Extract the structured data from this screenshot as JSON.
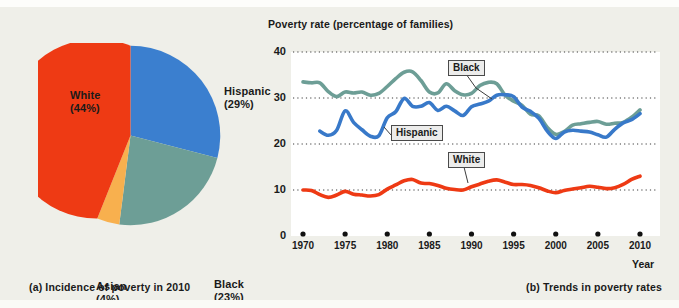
{
  "figure": {
    "panel_a_caption": "(a) Incidence of poverty in 2010",
    "panel_b_caption": "(b) Trends in poverty rates"
  },
  "pie": {
    "slices": [
      {
        "label": "Hispanic",
        "pct_text": "(29%)",
        "value": 29,
        "color": "#3b7fcf"
      },
      {
        "label": "Black",
        "pct_text": "(23%)",
        "value": 23,
        "color": "#6d9e96"
      },
      {
        "label": "Asian",
        "pct_text": "(4%)",
        "value": 4,
        "color": "#f8b04e"
      },
      {
        "label": "White",
        "pct_text": "(44%)",
        "value": 44,
        "color": "#ee3a14"
      }
    ]
  },
  "chart_data": {
    "type": "line",
    "title": "Poverty rate (percentage of families)",
    "xlabel": "Year",
    "ylabel": "",
    "xlim": [
      1970,
      2010
    ],
    "ylim": [
      0,
      40
    ],
    "grid": true,
    "yticks": [
      40,
      30,
      20,
      10,
      0
    ],
    "xticks": [
      1970,
      1975,
      1980,
      1985,
      1990,
      1995,
      2000,
      2005,
      2010
    ],
    "legend_position": "inline-annotations",
    "annotations": [
      {
        "text": "Black",
        "series": "Black"
      },
      {
        "text": "Hispanic",
        "series": "Hispanic"
      },
      {
        "text": "White",
        "series": "White"
      }
    ],
    "x": [
      1970,
      1971,
      1972,
      1973,
      1974,
      1975,
      1976,
      1977,
      1978,
      1979,
      1980,
      1981,
      1982,
      1983,
      1984,
      1985,
      1986,
      1987,
      1988,
      1989,
      1990,
      1991,
      1992,
      1993,
      1994,
      1995,
      1996,
      1997,
      1998,
      1999,
      2000,
      2001,
      2002,
      2003,
      2004,
      2005,
      2006,
      2007,
      2008,
      2009,
      2010
    ],
    "series": [
      {
        "name": "Black",
        "color": "#6d9e96",
        "values": [
          33.5,
          33.3,
          33.3,
          31.4,
          30.3,
          31.3,
          31.1,
          31.3,
          30.6,
          31.0,
          32.5,
          34.2,
          35.6,
          35.7,
          33.8,
          31.3,
          31.1,
          33.1,
          31.6,
          30.7,
          31.0,
          32.7,
          33.4,
          33.1,
          30.6,
          29.3,
          28.4,
          26.5,
          26.1,
          23.6,
          22.1,
          22.7,
          24.1,
          24.4,
          24.7,
          24.9,
          24.3,
          24.5,
          24.7,
          25.8,
          27.4
        ]
      },
      {
        "name": "Hispanic",
        "color": "#3879c9",
        "values": [
          null,
          null,
          22.8,
          21.9,
          23.0,
          27.2,
          24.7,
          23.1,
          21.7,
          21.8,
          25.7,
          27.0,
          29.9,
          28.2,
          28.2,
          29.0,
          27.3,
          28.2,
          27.2,
          26.2,
          28.1,
          28.7,
          29.3,
          30.6,
          30.7,
          30.3,
          28.0,
          27.1,
          25.6,
          22.8,
          21.2,
          22.6,
          23.0,
          22.8,
          22.6,
          22.0,
          21.5,
          23.2,
          24.6,
          25.3,
          26.6
        ]
      },
      {
        "name": "White",
        "color": "#ee3a14",
        "values": [
          10.0,
          9.9,
          9.0,
          8.4,
          8.9,
          9.7,
          9.1,
          8.9,
          8.7,
          9.0,
          10.2,
          11.1,
          12.0,
          12.3,
          11.5,
          11.4,
          11.0,
          10.4,
          10.1,
          10.0,
          10.7,
          11.3,
          11.9,
          12.2,
          11.7,
          11.2,
          11.2,
          11.0,
          10.5,
          9.8,
          9.4,
          9.9,
          10.2,
          10.5,
          10.8,
          10.6,
          10.3,
          10.5,
          11.2,
          12.3,
          13.0
        ]
      }
    ]
  }
}
